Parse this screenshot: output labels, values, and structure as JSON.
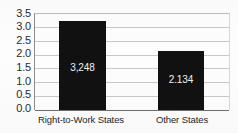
{
  "chart_data": {
    "type": "bar",
    "title": "",
    "xlabel": "",
    "ylabel": "",
    "categories": [
      "Right-to-Work States",
      "Other States"
    ],
    "values": [
      3.248,
      2.134
    ],
    "data_labels": [
      "3,248",
      "2.134"
    ],
    "ylim": [
      0.0,
      3.5
    ],
    "ytick_labels": [
      "3.5",
      "3.0",
      "2.5",
      "2.0",
      "1.5",
      "1.0",
      "0.5",
      "0.0"
    ],
    "ytick_values": [
      3.5,
      3.0,
      2.5,
      2.0,
      1.5,
      1.0,
      0.5,
      0.0
    ],
    "grid": true,
    "legend": false,
    "bar_color": "#111111",
    "label_color": "#f2f2f2",
    "gridline_color": "#c9c9c9",
    "axis_color": "#6f6f6f"
  }
}
